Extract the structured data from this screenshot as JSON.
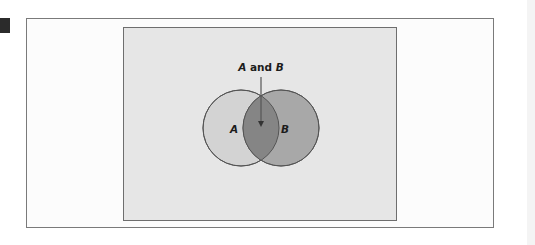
{
  "diagram": {
    "type": "venn",
    "title_label": {
      "set_a": "A",
      "connector": " and ",
      "set_b": "B"
    },
    "sets": [
      {
        "id": "A",
        "label": "A",
        "fill": "#d3d3d3"
      },
      {
        "id": "B",
        "label": "B",
        "fill": "#a8a8a8"
      }
    ],
    "intersection": {
      "label": "A and B",
      "fill": "#858585"
    },
    "colors": {
      "outer_panel": "#fcfcfc",
      "inner_panel": "#e6e6e6",
      "stroke": "#555555",
      "marker": "#2b2b2b"
    }
  }
}
